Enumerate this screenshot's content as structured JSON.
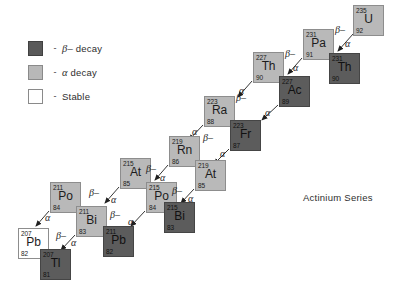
{
  "diagram": {
    "title": "Actinium Series",
    "legend": [
      {
        "swatch": "beta",
        "dash": "-",
        "symbol": "β–",
        "text": " decay",
        "name": "beta-decay"
      },
      {
        "swatch": "alpha",
        "dash": "-",
        "symbol": "α",
        "text": " decay",
        "name": "alpha-decay"
      },
      {
        "swatch": "stable",
        "dash": "-",
        "symbol": "",
        "text": "Stable",
        "name": "stable"
      }
    ],
    "colors": {
      "beta_fill": "#5c5c5c",
      "alpha_fill": "#b9b9b9",
      "stable_fill": "#ffffff",
      "border": "#8d8d8d",
      "text": "#1c1c1c"
    },
    "nuclides": [
      {
        "symbol": "U",
        "mass": "235",
        "z": "92",
        "type": "alpha",
        "x": 353,
        "y": 5
      },
      {
        "symbol": "Pa",
        "mass": "231",
        "z": "91",
        "type": "alpha",
        "x": 303,
        "y": 29
      },
      {
        "symbol": "Th",
        "mass": "231",
        "z": "90",
        "type": "beta",
        "x": 329,
        "y": 53
      },
      {
        "symbol": "Th",
        "mass": "227",
        "z": "90",
        "type": "alpha",
        "x": 253,
        "y": 52
      },
      {
        "symbol": "Ac",
        "mass": "227",
        "z": "89",
        "type": "beta",
        "x": 279,
        "y": 76
      },
      {
        "symbol": "Ra",
        "mass": "223",
        "z": "88",
        "type": "alpha",
        "x": 204,
        "y": 96
      },
      {
        "symbol": "Fr",
        "mass": "223",
        "z": "87",
        "type": "beta",
        "x": 230,
        "y": 120
      },
      {
        "symbol": "Rn",
        "mass": "219",
        "z": "86",
        "type": "alpha",
        "x": 169,
        "y": 136
      },
      {
        "symbol": "At",
        "mass": "219",
        "z": "85",
        "type": "alpha",
        "x": 195,
        "y": 160
      },
      {
        "symbol": "At",
        "mass": "215",
        "z": "85",
        "type": "alpha",
        "x": 120,
        "y": 158
      },
      {
        "symbol": "Po",
        "mass": "215",
        "z": "84",
        "type": "alpha",
        "x": 146,
        "y": 182
      },
      {
        "symbol": "Bi",
        "mass": "215",
        "z": "83",
        "type": "beta",
        "x": 164,
        "y": 202
      },
      {
        "symbol": "Po",
        "mass": "211",
        "z": "84",
        "type": "alpha",
        "x": 50,
        "y": 182
      },
      {
        "symbol": "Bi",
        "mass": "211",
        "z": "83",
        "type": "alpha",
        "x": 76,
        "y": 206
      },
      {
        "symbol": "Pb",
        "mass": "211",
        "z": "82",
        "type": "beta",
        "x": 103,
        "y": 226
      },
      {
        "symbol": "Pb",
        "mass": "207",
        "z": "82",
        "type": "stable",
        "x": 18,
        "y": 228
      },
      {
        "symbol": "Tl",
        "mass": "207",
        "z": "81",
        "type": "beta",
        "x": 40,
        "y": 249
      }
    ],
    "transitions": [
      {
        "kind": "alpha",
        "label": "α",
        "from": "U-235",
        "to": "Th-231",
        "lx": 345,
        "ly": 38
      },
      {
        "kind": "beta",
        "label": "β–",
        "from": "Th-231",
        "to": "Pa-231",
        "lx": 335,
        "ly": 24
      },
      {
        "kind": "alpha",
        "label": "α",
        "from": "Pa-231",
        "to": "Ac-227",
        "lx": 293,
        "ly": 62
      },
      {
        "kind": "beta",
        "label": "β–",
        "from": "Ac-227",
        "to": "Th-227",
        "lx": 285,
        "ly": 48
      },
      {
        "kind": "alpha",
        "label": "α",
        "from": "Th-227",
        "to": "Ra-223",
        "lx": 239,
        "ly": 85
      },
      {
        "kind": "beta",
        "label": "β–",
        "from": "Fr-223",
        "to": "Ra-223",
        "lx": 236,
        "ly": 92
      },
      {
        "kind": "alpha",
        "label": "α",
        "from": "Ac-227",
        "to": "Fr-223",
        "lx": 265,
        "ly": 107
      },
      {
        "kind": "alpha",
        "label": "α",
        "from": "Ra-223",
        "to": "Rn-219",
        "lx": 192,
        "ly": 126
      },
      {
        "kind": "alpha",
        "label": "α",
        "from": "Fr-223",
        "to": "At-219",
        "lx": 220,
        "ly": 148
      },
      {
        "kind": "beta",
        "label": "β–",
        "from": "At-219",
        "to": "Rn-219",
        "lx": 203,
        "ly": 132
      },
      {
        "kind": "alpha",
        "label": "α",
        "from": "Rn-219",
        "to": "Po-215",
        "lx": 160,
        "ly": 172
      },
      {
        "kind": "beta",
        "label": "β–",
        "from": "Po-215",
        "to": "At-215",
        "lx": 146,
        "ly": 163
      },
      {
        "kind": "alpha",
        "label": "α",
        "from": "At-219",
        "to": "Bi-215",
        "lx": 188,
        "ly": 193
      },
      {
        "kind": "beta",
        "label": "β–",
        "from": "Bi-215",
        "to": "Po-215",
        "lx": 172,
        "ly": 185
      },
      {
        "kind": "alpha",
        "label": "α",
        "from": "At-215",
        "to": "Bi-211",
        "lx": 111,
        "ly": 194
      },
      {
        "kind": "beta",
        "label": "β–",
        "from": "Bi-211",
        "to": "Po-211",
        "lx": 89,
        "ly": 187
      },
      {
        "kind": "alpha",
        "label": "α",
        "from": "Po-215",
        "to": "Pb-211",
        "lx": 128,
        "ly": 216
      },
      {
        "kind": "beta",
        "label": "β–",
        "from": "Pb-211",
        "to": "Bi-211",
        "lx": 110,
        "ly": 209
      },
      {
        "kind": "alpha",
        "label": "α",
        "from": "Po-211",
        "to": "Pb-207",
        "lx": 45,
        "ly": 212
      },
      {
        "kind": "alpha",
        "label": "α",
        "from": "Bi-211",
        "to": "Tl-207",
        "lx": 71,
        "ly": 237
      },
      {
        "kind": "beta",
        "label": "β–",
        "from": "Tl-207",
        "to": "Pb-207",
        "lx": 56,
        "ly": 230
      }
    ]
  }
}
